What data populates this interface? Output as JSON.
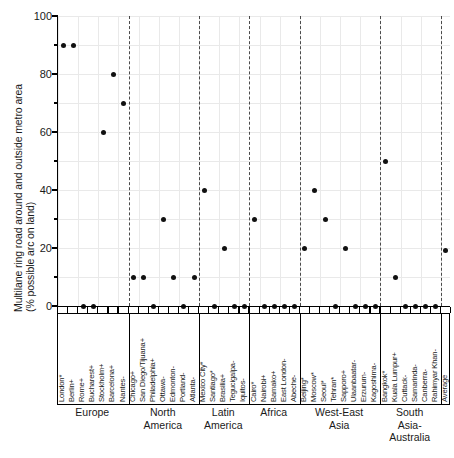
{
  "chart": {
    "type": "scatter",
    "title": "",
    "ylabel_line1": "Multilane ring road around and outside metro area",
    "ylabel_line2": "(% possible arc on land)",
    "xlabel": "",
    "ylim": [
      0,
      100
    ],
    "yticks": [
      0,
      20,
      40,
      60,
      80,
      100
    ],
    "ytick_labels": [
      "0",
      "20",
      "40",
      "60",
      "80",
      "100"
    ],
    "yminor_step": 10,
    "grid": true,
    "legend": "none"
  },
  "chart_data": {
    "type": "scatter",
    "title": "",
    "xlabel": "",
    "ylabel": "Multilane ring road around and outside metro area (% possible arc on land)",
    "ylim": [
      0,
      100
    ],
    "yticks": [
      0,
      20,
      40,
      60,
      80,
      100
    ],
    "grid": true,
    "categories": [
      "London*",
      "Berlin+",
      "Rome+",
      "Bucharest+",
      "Stockholm+",
      "Barcelona+",
      "Nantes-",
      "Chicago+",
      "San Diego/Tijuana+",
      "Philadelphia+",
      "Ottawa-",
      "Edmonton-",
      "Portland-",
      "Atlanta-",
      "Mexico City*",
      "Santiago*",
      "Brasilia+",
      "Tegucigalpa-",
      "Iquitos-",
      "Cairo*",
      "Nairobi+",
      "Bamako+",
      "East London-",
      "Abeche-",
      "Beijing*",
      "Moscow*",
      "Seoul*",
      "Tehran*",
      "Sapporo+",
      "Ulaanbaatar-",
      "Erzurum-",
      "Kagoshima-",
      "Bangkok*",
      "Kuala Lumpur+",
      "Cuttack-",
      "Samarinda-",
      "Canberra-",
      "Rahimyar Khan-",
      "Average"
    ],
    "values": [
      90,
      90,
      0,
      0,
      60,
      80,
      70,
      10,
      10,
      0,
      30,
      10,
      0,
      10,
      40,
      0,
      20,
      0,
      0,
      30,
      0,
      0,
      0,
      0,
      20,
      40,
      30,
      0,
      20,
      0,
      0,
      0,
      50,
      10,
      0,
      0,
      0,
      0,
      19
    ],
    "regions": [
      {
        "name": "Europe",
        "count": 7
      },
      {
        "name": "North\nAmerica",
        "count": 7
      },
      {
        "name": "Latin\nAmerica",
        "count": 5
      },
      {
        "name": "Africa",
        "count": 5
      },
      {
        "name": "West-East\nAsia",
        "count": 8
      },
      {
        "name": "South Asia-\nAustralia",
        "count": 6
      },
      {
        "name": "Average",
        "count": 1
      }
    ]
  }
}
